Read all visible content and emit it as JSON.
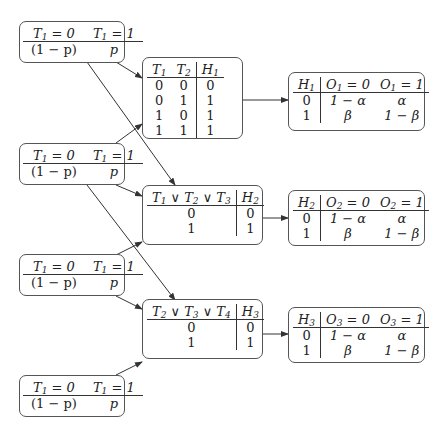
{
  "priors": [
    {
      "id": "prior-1",
      "header": [
        "T1 = 0",
        "T1 = 1"
      ],
      "values": [
        "(1 − p)",
        "p"
      ]
    },
    {
      "id": "prior-2",
      "header": [
        "T1 = 0",
        "T1 = 1"
      ],
      "values": [
        "(1 − p)",
        "p"
      ]
    },
    {
      "id": "prior-3",
      "header": [
        "T1 = 0",
        "T1 = 1"
      ],
      "values": [
        "(1 − p)",
        "p"
      ]
    },
    {
      "id": "prior-4",
      "header": [
        "T1 = 0",
        "T1 = 1"
      ],
      "values": [
        "(1 − p)",
        "p"
      ]
    }
  ],
  "hidden": {
    "h1": {
      "header": [
        "T1",
        "T2",
        "H1"
      ],
      "rows": [
        [
          "0",
          "0",
          "0"
        ],
        [
          "0",
          "1",
          "1"
        ],
        [
          "1",
          "0",
          "1"
        ],
        [
          "1",
          "1",
          "1"
        ]
      ]
    },
    "h2": {
      "header": [
        "T1 ∨ T2 ∨ T3",
        "H2"
      ],
      "rows": [
        [
          "0",
          "0"
        ],
        [
          "1",
          "1"
        ]
      ]
    },
    "h3": {
      "header": [
        "T2 ∨ T3 ∨ T4",
        "H3"
      ],
      "rows": [
        [
          "0",
          "0"
        ],
        [
          "1",
          "1"
        ]
      ]
    }
  },
  "observed": {
    "o1": {
      "header": [
        "H1",
        "O1 = 0",
        "O1 = 1"
      ],
      "rows": [
        [
          "0",
          "1 − α",
          "α"
        ],
        [
          "1",
          "β",
          "1 − β"
        ]
      ]
    },
    "o2": {
      "header": [
        "H2",
        "O2 = 0",
        "O2 = 1"
      ],
      "rows": [
        [
          "0",
          "1 − α",
          "α"
        ],
        [
          "1",
          "β",
          "1 − β"
        ]
      ]
    },
    "o3": {
      "header": [
        "H3",
        "O3 = 0",
        "O3 = 1"
      ],
      "rows": [
        [
          "0",
          "1 − α",
          "α"
        ],
        [
          "1",
          "β",
          "1 − β"
        ]
      ]
    }
  },
  "edges": [
    [
      "prior-1",
      "h1"
    ],
    [
      "prior-1",
      "h2"
    ],
    [
      "prior-2",
      "h1"
    ],
    [
      "prior-2",
      "h2"
    ],
    [
      "prior-2",
      "h3"
    ],
    [
      "prior-3",
      "h2"
    ],
    [
      "prior-3",
      "h3"
    ],
    [
      "prior-4",
      "h3"
    ],
    [
      "h1",
      "o1"
    ],
    [
      "h2",
      "o2"
    ],
    [
      "h3",
      "o3"
    ]
  ],
  "colors": {
    "line": "#333333",
    "border": "#555555",
    "background": "#ffffff"
  }
}
